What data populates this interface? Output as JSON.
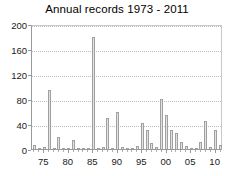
{
  "chart_data": {
    "type": "bar",
    "title": "Annual records 1973 - 2011",
    "xlabel": "",
    "ylabel": "",
    "ylim": [
      0,
      200
    ],
    "yticks": [
      0,
      40,
      80,
      120,
      160,
      200
    ],
    "ytick_labels": [
      "0",
      "40",
      "80",
      "120",
      "160",
      "200"
    ],
    "xlim": [
      1972.5,
      2011.5
    ],
    "xticks": [
      1975,
      1980,
      1985,
      1990,
      1995,
      2000,
      2005,
      2010
    ],
    "xtick_labels": [
      "75",
      "80",
      "85",
      "90",
      "95",
      "00",
      "05",
      "10"
    ],
    "grid": "horizontal-dotted",
    "legend": "none",
    "categories": [
      "1973",
      "1974",
      "1975",
      "1976",
      "1977",
      "1978",
      "1979",
      "1980",
      "1981",
      "1982",
      "1983",
      "1984",
      "1985",
      "1986",
      "1987",
      "1988",
      "1989",
      "1990",
      "1991",
      "1992",
      "1993",
      "1994",
      "1995",
      "1996",
      "1997",
      "1998",
      "1999",
      "2000",
      "2001",
      "2002",
      "2003",
      "2004",
      "2005",
      "2006",
      "2007",
      "2008",
      "2009",
      "2010",
      "2011"
    ],
    "values": [
      6,
      2,
      3,
      95,
      2,
      20,
      2,
      2,
      14,
      2,
      1,
      2,
      180,
      1,
      3,
      50,
      1,
      60,
      4,
      2,
      1,
      5,
      42,
      30,
      10,
      3,
      80,
      55,
      30,
      25,
      12,
      5,
      2,
      2,
      12,
      45,
      3,
      30,
      6
    ],
    "bar_color": "#e2e2e2",
    "bar_edge_color": "#a0a0a0",
    "grid_color": "#bdbdbd",
    "axis_color": "#9a9a9a",
    "text_color": "#1a1a1a",
    "background": "#ffffff"
  }
}
